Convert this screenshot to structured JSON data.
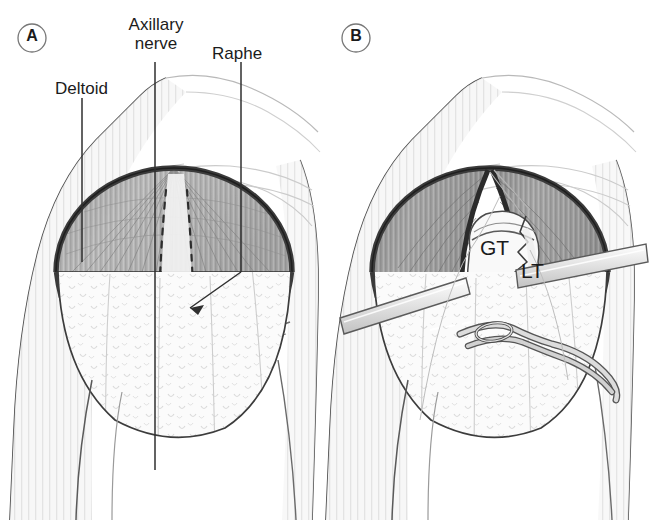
{
  "figure": {
    "background_color": "#ffffff",
    "width": 651,
    "height": 520
  },
  "panels": [
    {
      "id": "A",
      "marker_label": "A",
      "marker_shape": "circle",
      "description": "Anterolateral shoulder with intact deltoid; raphe and axillary nerve course marked by dashed lines",
      "labels": [
        {
          "name": "deltoid",
          "text": "Deltoid",
          "x": 55,
          "y": 79,
          "leader_x": 82,
          "leader_y1": 98,
          "leader_y2": 262
        },
        {
          "name": "axillary-nerve",
          "text": "Axillary\nnerve",
          "line1": "Axillary",
          "line2": "nerve",
          "x": 126,
          "y": 18,
          "leader_x": 155,
          "leader_y1": 62,
          "leader_y2": 470
        },
        {
          "name": "raphe",
          "text": "Raphe",
          "x": 212,
          "y": 44,
          "leader_x": 241,
          "leader_y1": 62,
          "leader_y2": 272
        }
      ]
    },
    {
      "id": "B",
      "marker_label": "B",
      "marker_shape": "circle",
      "description": "Deltoid split and held apart by retractors exposing tuberosity fracture fragments",
      "labels": [
        {
          "name": "greater-tuberosity",
          "text": "GT",
          "x": 480,
          "y": 240
        },
        {
          "name": "lesser-tuberosity",
          "text": "LT",
          "x": 520,
          "y": 262
        }
      ]
    }
  ],
  "colors": {
    "outline": "#2b2b2b",
    "muscle_dark": "#8e8e8e",
    "muscle_mid": "#b4b4b4",
    "muscle_light": "#d8d8d8",
    "rim_dark": "#4a4a4a",
    "skin_light": "#f4f4f4",
    "bone": "#f7f7f7",
    "instrument": "#e8e8e8",
    "label_text": "#1b1b1b",
    "leader_line": "#3a3a3a",
    "faint_contour": "#cfcfcf"
  }
}
